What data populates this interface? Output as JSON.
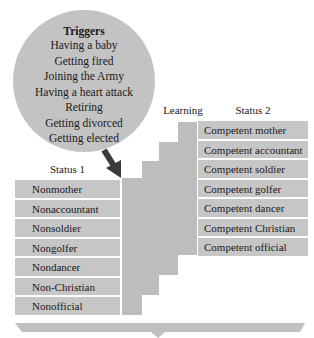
{
  "triggers": {
    "title": "Triggers",
    "items": [
      "Having a baby",
      "Getting fired",
      "Joining the Army",
      "Having a heart attack",
      "Retiring",
      "Getting divorced",
      "Getting elected"
    ]
  },
  "learning": {
    "label": "Learning"
  },
  "status1": {
    "label": "Status 1",
    "items": [
      "Nonmother",
      "Nonaccountant",
      "Nonsoldier",
      "Nongolfer",
      "Nondancer",
      "Non-Christian",
      "Nonofficial"
    ]
  },
  "status2": {
    "label": "Status 2",
    "items": [
      "Competent mother",
      "Competent accountant",
      "Competent soldier",
      "Competent golfer",
      "Competent dancer",
      "Competent Christian",
      "Competent official"
    ]
  },
  "colors": {
    "circle": "#c3c3c3",
    "box": "#c6c6c6",
    "stairs": "#bdbdbd",
    "arrow": "#3a3a3a",
    "brace": "#bfbfbf"
  }
}
